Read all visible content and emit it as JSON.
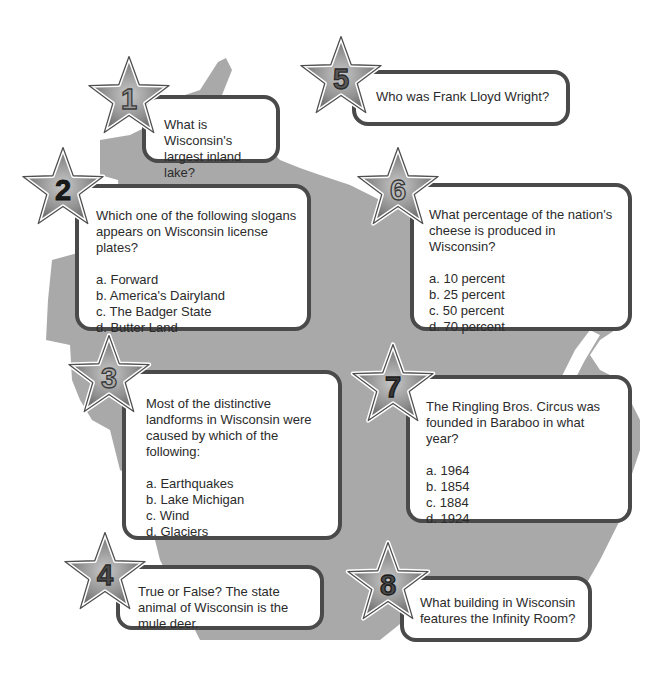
{
  "colors": {
    "map_fill": "#a9a9a9",
    "box_border": "#4a4a4a",
    "box_fill": "#ffffff",
    "text": "#2b2b2b",
    "star_fill": "#8a8a8a",
    "star_outline": "#ffffff"
  },
  "questions": [
    {
      "number": "1",
      "question": "What is Wisconsin's largest inland lake?",
      "options": []
    },
    {
      "number": "2",
      "question": "Which one of the following slogans appears on Wisconsin license plates?",
      "options": [
        "a. Forward",
        "b. America's Dairyland",
        "c. The Badger State",
        "d. Butter Land"
      ]
    },
    {
      "number": "3",
      "question": "Most of the distinctive landforms in Wisconsin were caused by which of the following:",
      "options": [
        "a. Earthquakes",
        "b. Lake Michigan",
        "c. Wind",
        "d. Glaciers"
      ]
    },
    {
      "number": "4",
      "question": "True or False? The state animal of Wisconsin is the mule deer.",
      "options": []
    },
    {
      "number": "5",
      "question": "Who was Frank Lloyd Wright?",
      "options": []
    },
    {
      "number": "6",
      "question": "What percentage of the nation's cheese is produced in Wisconsin?",
      "options": [
        "a. 10 percent",
        "b. 25 percent",
        "c. 50 percent",
        "d. 70 percent"
      ]
    },
    {
      "number": "7",
      "question": "The Ringling Bros. Circus was founded in Baraboo in what year?",
      "options": [
        "a. 1964",
        "b. 1854",
        "c. 1884",
        "d. 1924"
      ]
    },
    {
      "number": "8",
      "question": "What building in Wisconsin features the Infinity Room?",
      "options": []
    }
  ]
}
